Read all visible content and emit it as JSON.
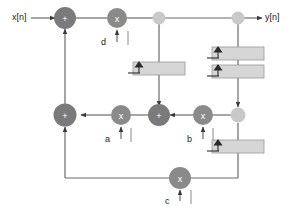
{
  "diagram": {
    "input_label": "x[n]",
    "output_label": "y[n]",
    "colors": {
      "adder_fill": "#7a7a7a",
      "multiplier_fill": "#8a8a8a",
      "branch_fill": "#c9c9c9",
      "delay_fill": "#d6d6d6",
      "line": "#5a5a5a",
      "text": "#1a1a1a"
    },
    "coefficients": [
      {
        "name": "d",
        "label": "d"
      },
      {
        "name": "a",
        "label": "a"
      },
      {
        "name": "b",
        "label": "b"
      },
      {
        "name": "c",
        "label": "c"
      }
    ],
    "nodes": [
      {
        "id": "sum-top",
        "type": "adder",
        "glyph": "+",
        "x": 65,
        "y": 18
      },
      {
        "id": "mult-d",
        "type": "multiplier",
        "glyph": "x",
        "x": 117,
        "y": 18
      },
      {
        "id": "branch-top-mid",
        "type": "branch",
        "glyph": "",
        "x": 159,
        "y": 18
      },
      {
        "id": "branch-top-right",
        "type": "branch",
        "glyph": "",
        "x": 238,
        "y": 18
      },
      {
        "id": "sum-left",
        "type": "adder",
        "glyph": "+",
        "x": 70,
        "y": 115
      },
      {
        "id": "mult-a",
        "type": "multiplier",
        "glyph": "x",
        "x": 121,
        "y": 115
      },
      {
        "id": "sum-mid",
        "type": "adder",
        "glyph": "+",
        "x": 159,
        "y": 115
      },
      {
        "id": "mult-b",
        "type": "multiplier",
        "glyph": "x",
        "x": 203,
        "y": 115
      },
      {
        "id": "branch-mid-right",
        "type": "branch",
        "glyph": "",
        "x": 238,
        "y": 115
      },
      {
        "id": "mult-c",
        "type": "multiplier",
        "glyph": "x",
        "x": 180,
        "y": 178
      }
    ],
    "delays": [
      {
        "id": "delay-mid",
        "x": 133,
        "y": 62,
        "w": 52,
        "h": 13
      },
      {
        "id": "delay-right-upper",
        "x": 212,
        "y": 47,
        "w": 52,
        "h": 13
      },
      {
        "id": "delay-right-lower",
        "x": 212,
        "y": 65,
        "w": 52,
        "h": 13
      },
      {
        "id": "delay-right-bottom",
        "x": 212,
        "y": 140,
        "w": 52,
        "h": 13
      }
    ]
  }
}
